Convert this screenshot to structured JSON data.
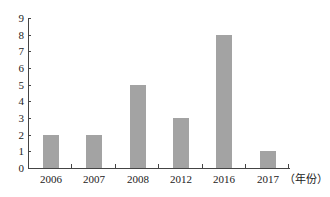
{
  "chart_data": {
    "type": "bar",
    "title": "",
    "xlabel": "（年份）",
    "ylabel": "",
    "categories": [
      "2006",
      "2007",
      "2008",
      "2012",
      "2016",
      "2017"
    ],
    "values": [
      2,
      2,
      5,
      3,
      8,
      1
    ],
    "ylim": [
      0,
      9
    ],
    "yticks": [
      0,
      1,
      2,
      3,
      4,
      5,
      6,
      7,
      8,
      9
    ],
    "grid": false,
    "legend": null,
    "bar_color": "#a3a3a3",
    "axis_color": "#444444"
  },
  "labels": {
    "x_unit": "（年份）"
  }
}
